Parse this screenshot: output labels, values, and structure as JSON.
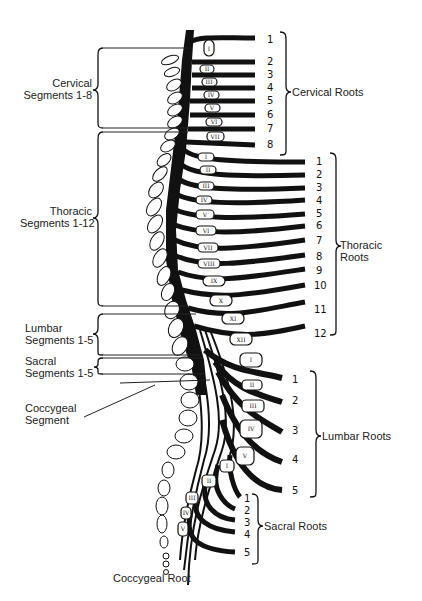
{
  "left_labels": {
    "cervical_segments": [
      "Cervical",
      "Segments 1-8"
    ],
    "thoracic_segments": [
      "Thoracic",
      "Segments 1-12"
    ],
    "lumbar_segments": [
      "Lumbar",
      "Segments 1-5"
    ],
    "sacral_segments": [
      "Sacral",
      "Segments 1-5"
    ],
    "coccygeal_segment": [
      "Coccygeal",
      "Segment"
    ]
  },
  "right_labels": {
    "cervical_roots": "Cervical Roots",
    "thoracic_roots": [
      "Thoracic",
      "Roots"
    ],
    "lumbar_roots": "Lumbar Roots",
    "sacral_roots": "Sacral Roots",
    "coccygeal_root": "Coccygeal Root"
  },
  "root_numbers": {
    "cervical": [
      "1",
      "2",
      "3",
      "4",
      "5",
      "6",
      "7",
      "8"
    ],
    "thoracic": [
      "1",
      "2",
      "3",
      "4",
      "5",
      "6",
      "7",
      "8",
      "9",
      "10",
      "11",
      "12"
    ],
    "lumbar": [
      "1",
      "2",
      "3",
      "4",
      "5"
    ],
    "sacral": [
      "1",
      "2",
      "3",
      "4",
      "5"
    ]
  },
  "vertebra_numerals": {
    "cervical": [
      "I",
      "II",
      "III",
      "IV",
      "V",
      "VI",
      "VII"
    ],
    "thoracic": [
      "I",
      "II",
      "III",
      "IV",
      "V",
      "VI",
      "VII",
      "VIII",
      "IX",
      "X",
      "XI",
      "XII"
    ],
    "lumbar": [
      "I",
      "II",
      "III",
      "IV",
      "V"
    ],
    "sacral": [
      "I",
      "II",
      "III",
      "IV",
      "V"
    ]
  },
  "colors": {
    "ink": "#111111",
    "background": "#ffffff"
  }
}
